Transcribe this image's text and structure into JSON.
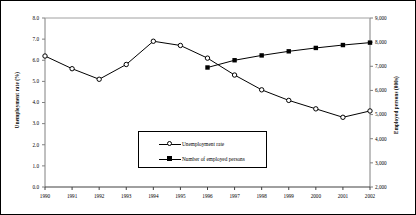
{
  "chart_data": {
    "type": "line",
    "title": "",
    "subtitle": "",
    "xlabel": "",
    "categories": [
      "1990",
      "1991",
      "1992",
      "1993",
      "1994",
      "1995",
      "1996",
      "1997",
      "1998",
      "1999",
      "2000",
      "2001",
      "2002"
    ],
    "grid": false,
    "legend_position": "inside-bottom-center",
    "axes": {
      "left": {
        "label": "Unemployment rate (%)",
        "min": 0.0,
        "max": 8.0,
        "step": 1.0,
        "ticks": [
          "0.0",
          "1.0",
          "2.0",
          "3.0",
          "4.0",
          "5.0",
          "6.0",
          "7.0",
          "8.0"
        ]
      },
      "right": {
        "label": "Employed persons (000s)",
        "min": 2000,
        "max": 9000,
        "step": 1000,
        "ticks": [
          "2,000",
          "3,000",
          "4,000",
          "5,000",
          "6,000",
          "7,000",
          "8,000",
          "9,000"
        ]
      }
    },
    "series": [
      {
        "name": "Unemployment rate",
        "axis": "left",
        "marker": "open-circle",
        "values": [
          6.2,
          5.6,
          5.1,
          5.8,
          6.9,
          6.7,
          6.1,
          5.3,
          4.6,
          4.1,
          3.7,
          3.3,
          3.6
        ]
      },
      {
        "name": "Number of employed persons",
        "axis": "right",
        "marker": "filled-square",
        "values": [
          null,
          null,
          null,
          null,
          null,
          null,
          6950,
          7250,
          7450,
          7620,
          7760,
          7880,
          7980
        ]
      }
    ]
  },
  "legend": {
    "items": [
      {
        "label": "Unemployment rate",
        "marker": "open-circle-marker"
      },
      {
        "label": "Number of employed persons",
        "marker": "filled-square-marker"
      }
    ]
  }
}
